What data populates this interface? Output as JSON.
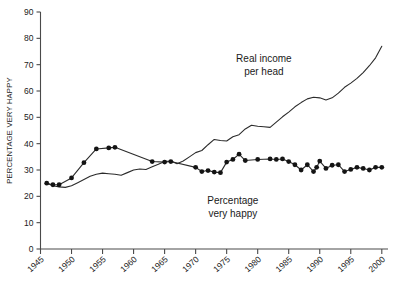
{
  "chart_data": {
    "type": "line",
    "title": "",
    "xlabel": "",
    "ylabel": "PERCENTAGE VERY HAPPY",
    "xlim": [
      1945,
      2001
    ],
    "ylim": [
      0,
      90
    ],
    "grid": false,
    "legend_position": "inline-annotation",
    "yticks": [
      0,
      10,
      20,
      30,
      40,
      50,
      60,
      70,
      80,
      90
    ],
    "xticks": [
      1945,
      1950,
      1955,
      1960,
      1965,
      1970,
      1975,
      1980,
      1985,
      1990,
      1995,
      2000
    ],
    "annotations": [
      {
        "name": "real-income-annotation",
        "text_line1": "Real income",
        "text_line2": "per head",
        "x": 1981,
        "y": 71
      },
      {
        "name": "percentage-very-happy-annotation",
        "text_line1": "Percentage",
        "text_line2": "very happy",
        "x": 1976,
        "y": 17
      }
    ],
    "series": [
      {
        "name": "Real income per head",
        "markers": false,
        "points": [
          [
            1946,
            25.0
          ],
          [
            1947,
            24.0
          ],
          [
            1948,
            23.6
          ],
          [
            1949,
            23.4
          ],
          [
            1950,
            24.0
          ],
          [
            1951,
            25.2
          ],
          [
            1952,
            26.4
          ],
          [
            1953,
            27.6
          ],
          [
            1954,
            28.4
          ],
          [
            1955,
            28.8
          ],
          [
            1956,
            28.6
          ],
          [
            1957,
            28.4
          ],
          [
            1958,
            28.0
          ],
          [
            1959,
            29.0
          ],
          [
            1960,
            30.0
          ],
          [
            1961,
            30.4
          ],
          [
            1962,
            30.2
          ],
          [
            1963,
            31.2
          ],
          [
            1964,
            32.2
          ],
          [
            1965,
            33.2
          ],
          [
            1966,
            33.4
          ],
          [
            1967,
            32.4
          ],
          [
            1968,
            33.4
          ],
          [
            1969,
            35.0
          ],
          [
            1970,
            36.6
          ],
          [
            1971,
            37.4
          ],
          [
            1972,
            39.6
          ],
          [
            1973,
            41.6
          ],
          [
            1974,
            41.2
          ],
          [
            1975,
            41.0
          ],
          [
            1976,
            42.6
          ],
          [
            1977,
            43.4
          ],
          [
            1978,
            45.6
          ],
          [
            1979,
            47.0
          ],
          [
            1980,
            46.6
          ],
          [
            1981,
            46.4
          ],
          [
            1982,
            46.2
          ],
          [
            1983,
            48.2
          ],
          [
            1984,
            50.2
          ],
          [
            1985,
            52.0
          ],
          [
            1986,
            54.0
          ],
          [
            1987,
            55.6
          ],
          [
            1988,
            57.0
          ],
          [
            1989,
            57.6
          ],
          [
            1990,
            57.4
          ],
          [
            1991,
            56.6
          ],
          [
            1992,
            57.4
          ],
          [
            1993,
            59.2
          ],
          [
            1994,
            61.4
          ],
          [
            1995,
            63.0
          ],
          [
            1996,
            64.8
          ],
          [
            1997,
            67.0
          ],
          [
            1998,
            69.6
          ],
          [
            1999,
            72.6
          ],
          [
            2000,
            77.0
          ]
        ]
      },
      {
        "name": "Percentage very happy",
        "markers": true,
        "points": [
          [
            1946,
            25.0
          ],
          [
            1947,
            24.4
          ],
          [
            1948,
            24.4
          ],
          [
            1950,
            27.0
          ],
          [
            1952,
            32.8
          ],
          [
            1954,
            38.0
          ],
          [
            1956,
            38.4
          ],
          [
            1957,
            38.6
          ],
          [
            1963,
            33.2
          ],
          [
            1965,
            33.0
          ],
          [
            1966,
            33.2
          ],
          [
            1970,
            31.0
          ],
          [
            1971,
            29.4
          ],
          [
            1972,
            29.8
          ],
          [
            1973,
            29.2
          ],
          [
            1974,
            29.0
          ],
          [
            1975,
            33.0
          ],
          [
            1976,
            34.0
          ],
          [
            1977,
            36.0
          ],
          [
            1978,
            33.6
          ],
          [
            1980,
            34.0
          ],
          [
            1982,
            34.2
          ],
          [
            1983,
            34.0
          ],
          [
            1984,
            34.2
          ],
          [
            1985,
            33.2
          ],
          [
            1986,
            32.0
          ],
          [
            1987,
            30.0
          ],
          [
            1988,
            32.0
          ],
          [
            1989,
            29.4
          ],
          [
            1990,
            33.4
          ],
          [
            1991,
            30.6
          ],
          [
            1993,
            32.0
          ],
          [
            1994,
            29.4
          ],
          [
            1996,
            31.0
          ],
          [
            1998,
            30.0
          ],
          [
            1989.5,
            31.0
          ],
          [
            1992,
            31.8
          ],
          [
            1995,
            30.2
          ],
          [
            1997,
            30.6
          ],
          [
            1999,
            31.0
          ],
          [
            2000,
            31.0
          ]
        ]
      }
    ]
  }
}
